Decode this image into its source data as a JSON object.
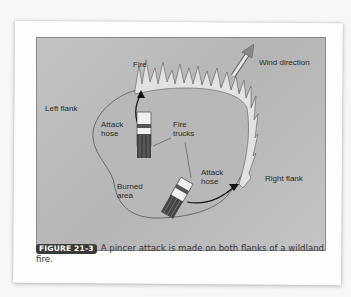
{
  "figure": {
    "labels": {
      "fire": "Fire",
      "wind_direction": "Wind direction",
      "left_flank": "Left flank",
      "right_flank": "Right flank",
      "attack_hose_left": "Attack hose",
      "attack_hose_right": "Attack hose",
      "fire_trucks": "Fire trucks",
      "burned_area": "Burned area"
    }
  },
  "caption": {
    "badge": "FIGURE 21-3",
    "text": "A pincer attack is made on both flanks of a wildland fire."
  },
  "colors": {
    "badge_bg": "#3a3a3a",
    "figure_bg": "#bdbdbd"
  }
}
